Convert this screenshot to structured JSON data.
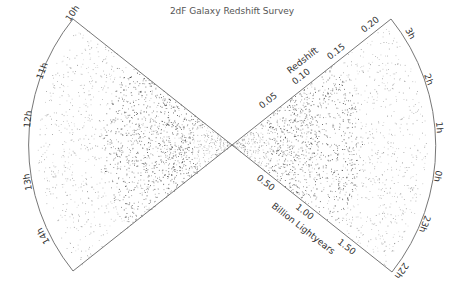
{
  "title": "2dF Galaxy Redshift Survey",
  "left_cone": {
    "ra_labels": [
      "10h",
      "11h",
      "12h",
      "13h",
      "14h"
    ]
  },
  "right_cone": {
    "ra_labels": [
      "3h",
      "2h",
      "1h",
      "0h",
      "23h",
      "22h"
    ]
  },
  "redshift_axis": {
    "label": "Redshift",
    "ticks": [
      "0.05",
      "0.10",
      "0.15",
      "0.20"
    ]
  },
  "distance_axis": {
    "label": "Billion Lightyears",
    "ticks": [
      "0.50",
      "1.00",
      "1.50"
    ]
  },
  "colors": {
    "outline": "#777777",
    "galaxy": "#222222",
    "title": "#666666"
  }
}
